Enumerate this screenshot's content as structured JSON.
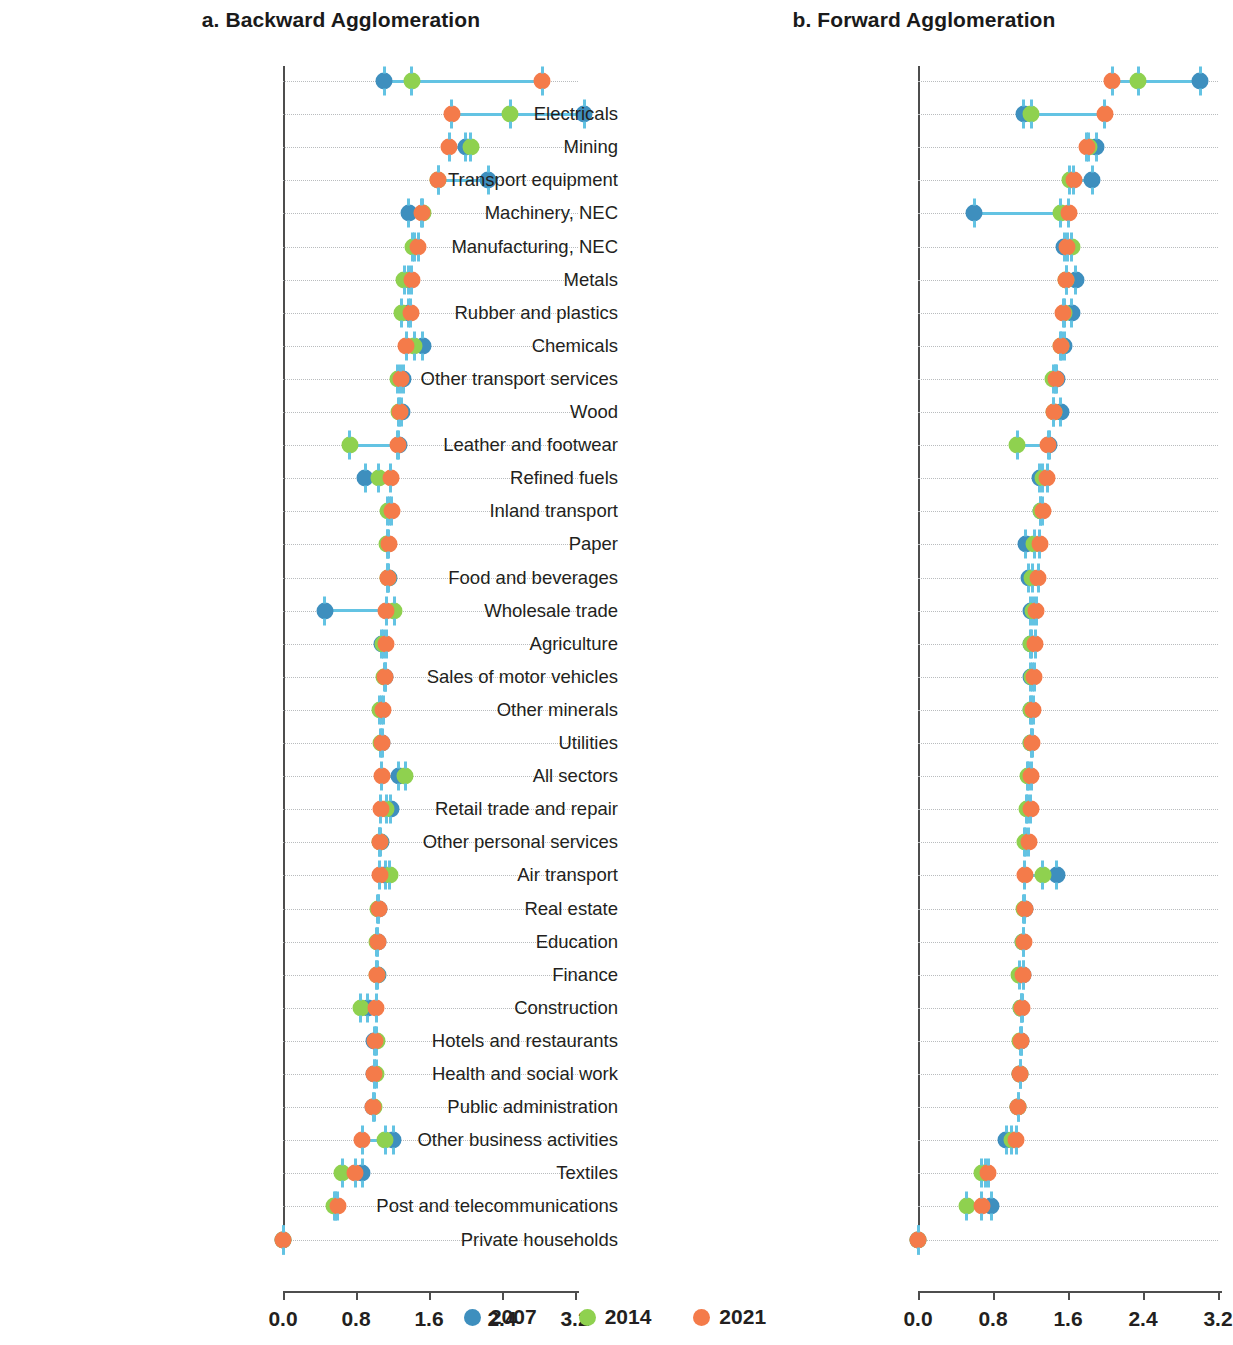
{
  "legend": {
    "position": "bottom-center",
    "entries": [
      {
        "label": "2007",
        "color": "#3e8fbe"
      },
      {
        "label": "2014",
        "color": "#8fd14f"
      },
      {
        "label": "2021",
        "color": "#f47b4a"
      }
    ]
  },
  "connector_color": "#63c3e3",
  "axis": {
    "ticks": [
      "0.0",
      "0.8",
      "1.6",
      "2.4",
      "3.2"
    ],
    "tick_values": [
      0.0,
      0.8,
      1.6,
      2.4,
      3.2
    ],
    "xlim": [
      0.0,
      3.45
    ]
  },
  "chart_data": [
    {
      "type": "scatter",
      "title": "a. Backward Agglomeration",
      "xlabel": "",
      "ylabel": "",
      "xlim": [
        0.0,
        3.45
      ],
      "xticks": [
        0.0,
        0.8,
        1.6,
        2.4,
        3.2
      ],
      "grid": "dotted horizontal row lines",
      "series_names": [
        "2007",
        "2014",
        "2021"
      ],
      "rows": [
        {
          "label": "",
          "v2007": 1.11,
          "v2014": 1.41,
          "v2021": 2.84
        },
        {
          "label": "Water transport",
          "v2007": 3.3,
          "v2014": 2.49,
          "v2021": 1.85
        },
        {
          "label": "Manufacturing, NEC",
          "v2007": 2.0,
          "v2014": 2.06,
          "v2021": 1.82
        },
        {
          "label": "Transport equipment",
          "v2007": 2.25,
          "v2014": 1.7,
          "v2021": 1.7
        },
        {
          "label": "Other minerals",
          "v2007": 1.38,
          "v2014": 1.53,
          "v2021": 1.52
        },
        {
          "label": "Chemicals",
          "v2007": 1.44,
          "v2014": 1.42,
          "v2021": 1.48
        },
        {
          "label": "Metals",
          "v2007": 1.38,
          "v2014": 1.33,
          "v2021": 1.41
        },
        {
          "label": "Wood",
          "v2007": 1.38,
          "v2014": 1.3,
          "v2021": 1.4
        },
        {
          "label": "Rubber and plastics",
          "v2007": 1.53,
          "v2014": 1.44,
          "v2021": 1.35
        },
        {
          "label": "Mining",
          "v2007": 1.32,
          "v2014": 1.26,
          "v2021": 1.29
        },
        {
          "label": "Other transport services",
          "v2007": 1.3,
          "v2014": 1.27,
          "v2021": 1.28
        },
        {
          "label": "Leather and footwear",
          "v2007": 1.27,
          "v2014": 0.73,
          "v2021": 1.26
        },
        {
          "label": "Paper",
          "v2007": 0.9,
          "v2014": 1.05,
          "v2021": 1.18
        },
        {
          "label": "Wholesale trade",
          "v2007": 1.17,
          "v2014": 1.15,
          "v2021": 1.19
        },
        {
          "label": "Sales of motor vehicles",
          "v2007": 1.15,
          "v2014": 1.14,
          "v2021": 1.16
        },
        {
          "label": "Inland transport",
          "v2007": 1.16,
          "v2014": 1.15,
          "v2021": 1.15
        },
        {
          "label": "Machinery, NEC",
          "v2007": 0.46,
          "v2014": 1.22,
          "v2021": 1.13
        },
        {
          "label": "Food and beverages",
          "v2007": 1.08,
          "v2014": 1.1,
          "v2021": 1.13
        },
        {
          "label": "Other personal services",
          "v2007": 1.12,
          "v2014": 1.11,
          "v2021": 1.12
        },
        {
          "label": "All sectors",
          "v2007": 1.08,
          "v2014": 1.06,
          "v2021": 1.1
        },
        {
          "label": "Retail trade and repair",
          "v2007": 1.08,
          "v2014": 1.07,
          "v2021": 1.09
        },
        {
          "label": "Air transport",
          "v2007": 1.27,
          "v2014": 1.34,
          "v2021": 1.08
        },
        {
          "label": "Agriculture",
          "v2007": 1.18,
          "v2014": 1.13,
          "v2021": 1.07
        },
        {
          "label": "Finance",
          "v2007": 1.07,
          "v2014": 1.06,
          "v2021": 1.06
        },
        {
          "label": "Utilities",
          "v2007": 1.12,
          "v2014": 1.17,
          "v2021": 1.06
        },
        {
          "label": "Education",
          "v2007": 1.05,
          "v2014": 1.04,
          "v2021": 1.05
        },
        {
          "label": "Real estate",
          "v2007": 1.04,
          "v2014": 1.03,
          "v2021": 1.04
        },
        {
          "label": "Public administration",
          "v2007": 1.04,
          "v2014": 1.03,
          "v2021": 1.03
        },
        {
          "label": "Other business activities",
          "v2007": 0.93,
          "v2014": 0.85,
          "v2021": 1.02
        },
        {
          "label": "Construction",
          "v2007": 1.0,
          "v2014": 1.03,
          "v2021": 1.01
        },
        {
          "label": "Hotels and restaurants",
          "v2007": 1.0,
          "v2014": 1.02,
          "v2021": 1.0
        },
        {
          "label": "Health and social work",
          "v2007": 0.99,
          "v2014": 1.0,
          "v2021": 0.99
        },
        {
          "label": "Refined fuels",
          "v2007": 1.21,
          "v2014": 1.12,
          "v2021": 0.87
        },
        {
          "label": "Post and telecommunications",
          "v2007": 0.87,
          "v2014": 0.65,
          "v2021": 0.79
        },
        {
          "label": "Textiles",
          "v2007": 0.58,
          "v2014": 0.56,
          "v2021": 0.6
        },
        {
          "label": "Private households",
          "v2007": 0.0,
          "v2014": 0.0,
          "v2021": 0.0
        }
      ]
    },
    {
      "type": "scatter",
      "title": "b. Forward Agglomeration",
      "xlabel": "",
      "ylabel": "",
      "xlim": [
        0.0,
        3.45
      ],
      "xticks": [
        0.0,
        0.8,
        1.6,
        2.4,
        3.2
      ],
      "grid": "dotted horizontal row lines",
      "series_names": [
        "2007",
        "2014",
        "2021"
      ],
      "rows": [
        {
          "label": "",
          "v2007": 3.01,
          "v2014": 2.35,
          "v2021": 2.07
        },
        {
          "label": "Electricals",
          "v2007": 1.13,
          "v2014": 1.21,
          "v2021": 1.99
        },
        {
          "label": "Mining",
          "v2007": 1.9,
          "v2014": 1.82,
          "v2021": 1.8
        },
        {
          "label": "Transport equipment",
          "v2007": 1.86,
          "v2014": 1.62,
          "v2021": 1.66
        },
        {
          "label": "Machinery, NEC",
          "v2007": 0.6,
          "v2014": 1.52,
          "v2021": 1.61
        },
        {
          "label": "Manufacturing, NEC",
          "v2007": 1.56,
          "v2014": 1.64,
          "v2021": 1.59
        },
        {
          "label": "Metals",
          "v2007": 1.68,
          "v2014": 1.58,
          "v2021": 1.58
        },
        {
          "label": "Rubber and plastics",
          "v2007": 1.64,
          "v2014": 1.56,
          "v2021": 1.55
        },
        {
          "label": "Chemicals",
          "v2007": 1.56,
          "v2014": 1.53,
          "v2021": 1.52
        },
        {
          "label": "Other transport services",
          "v2007": 1.48,
          "v2014": 1.44,
          "v2021": 1.47
        },
        {
          "label": "Wood",
          "v2007": 1.52,
          "v2014": 1.45,
          "v2021": 1.45
        },
        {
          "label": "Leather and footwear",
          "v2007": 1.4,
          "v2014": 1.06,
          "v2021": 1.39
        },
        {
          "label": "Refined fuels",
          "v2007": 1.3,
          "v2014": 1.33,
          "v2021": 1.38
        },
        {
          "label": "Inland transport",
          "v2007": 1.31,
          "v2014": 1.31,
          "v2021": 1.33
        },
        {
          "label": "Paper",
          "v2007": 1.15,
          "v2014": 1.24,
          "v2021": 1.3
        },
        {
          "label": "Food and beverages",
          "v2007": 1.18,
          "v2014": 1.22,
          "v2021": 1.28
        },
        {
          "label": "Wholesale trade",
          "v2007": 1.2,
          "v2014": 1.23,
          "v2021": 1.26
        },
        {
          "label": "Agriculture",
          "v2007": 1.2,
          "v2014": 1.21,
          "v2021": 1.25
        },
        {
          "label": "Sales of motor vehicles",
          "v2007": 1.2,
          "v2014": 1.22,
          "v2021": 1.24
        },
        {
          "label": "Other minerals",
          "v2007": 1.21,
          "v2014": 1.2,
          "v2021": 1.23
        },
        {
          "label": "Utilities",
          "v2007": 1.21,
          "v2014": 1.21,
          "v2021": 1.22
        },
        {
          "label": "All sectors",
          "v2007": 1.18,
          "v2014": 1.17,
          "v2021": 1.21
        },
        {
          "label": "Retail trade and repair",
          "v2007": 1.17,
          "v2014": 1.16,
          "v2021": 1.2
        },
        {
          "label": "Other personal services",
          "v2007": 1.15,
          "v2014": 1.14,
          "v2021": 1.18
        },
        {
          "label": "Air transport",
          "v2007": 1.48,
          "v2014": 1.33,
          "v2021": 1.14
        },
        {
          "label": "Real estate",
          "v2007": 1.14,
          "v2014": 1.13,
          "v2021": 1.14
        },
        {
          "label": "Education",
          "v2007": 1.12,
          "v2014": 1.12,
          "v2021": 1.13
        },
        {
          "label": "Finance",
          "v2007": 1.12,
          "v2014": 1.08,
          "v2021": 1.12
        },
        {
          "label": "Construction",
          "v2007": 1.1,
          "v2014": 1.1,
          "v2021": 1.11
        },
        {
          "label": "Hotels and restaurants",
          "v2007": 1.1,
          "v2014": 1.09,
          "v2021": 1.1
        },
        {
          "label": "Health and social work",
          "v2007": 1.09,
          "v2014": 1.09,
          "v2021": 1.09
        },
        {
          "label": "Public administration",
          "v2007": 1.07,
          "v2014": 1.07,
          "v2021": 1.07
        },
        {
          "label": "Other business activities",
          "v2007": 0.94,
          "v2014": 1.0,
          "v2021": 1.05
        },
        {
          "label": "Textiles",
          "v2007": 0.72,
          "v2014": 0.68,
          "v2021": 0.75
        },
        {
          "label": "Post and telecommunications",
          "v2007": 0.78,
          "v2014": 0.52,
          "v2021": 0.68
        },
        {
          "label": "Private households",
          "v2007": 0.0,
          "v2014": 0.0,
          "v2021": 0.0
        }
      ]
    }
  ]
}
